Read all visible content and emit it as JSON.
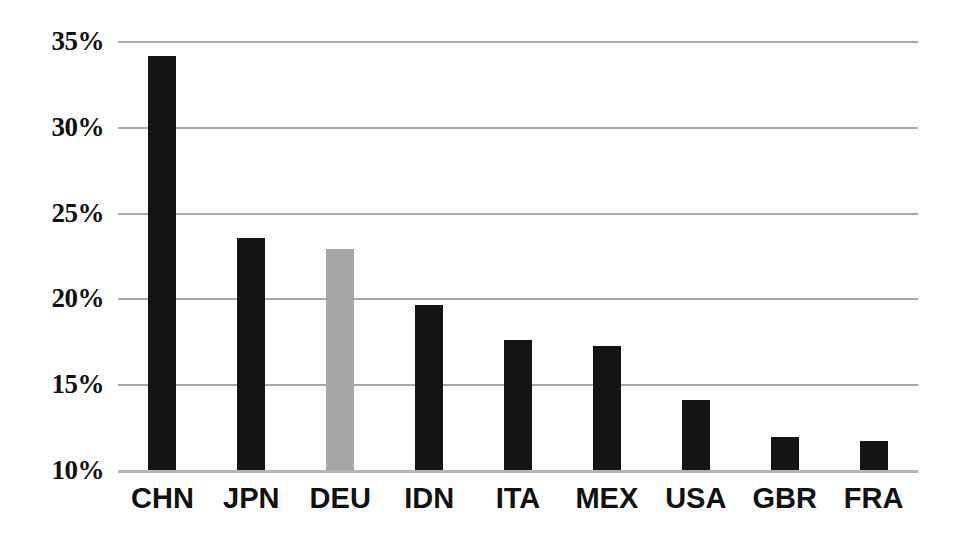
{
  "chart_data": {
    "type": "bar",
    "title": "",
    "subtitle": "",
    "xlabel": "",
    "ylabel": "",
    "categories": [
      "CHN",
      "JPN",
      "DEU",
      "IDN",
      "ITA",
      "MEX",
      "USA",
      "GBR",
      "FRA"
    ],
    "values": [
      34.1,
      23.5,
      22.9,
      19.6,
      17.6,
      17.2,
      14.1,
      11.9,
      11.7
    ],
    "value_suffix": "%",
    "ylim": [
      10,
      35
    ],
    "yticks": [
      10,
      15,
      20,
      25,
      30,
      35
    ],
    "ytick_labels": [
      "10%",
      "15%",
      "20%",
      "25%",
      "30%",
      "35%"
    ],
    "grid": true,
    "grid_axis": "y",
    "legend": false,
    "legend_position": "none",
    "bar_colors": [
      "#141414",
      "#141414",
      "#a6a6a6",
      "#141414",
      "#141414",
      "#141414",
      "#141414",
      "#141414",
      "#141414"
    ],
    "highlighted_category": "DEU",
    "colors": {
      "bar_default": "#141414",
      "bar_highlight": "#a6a6a6",
      "gridline": "#a8a8a8",
      "baseline": "#b4b4b4",
      "text": "#111111",
      "background": "#ffffff"
    }
  }
}
